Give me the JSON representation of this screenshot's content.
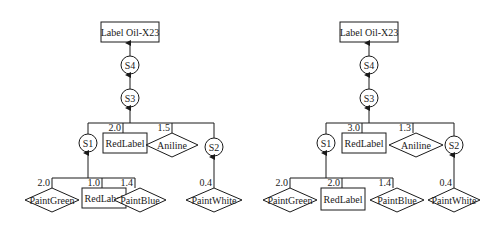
{
  "diagrams": [
    {
      "root": "Label Oil-X23",
      "s4": "S4",
      "s3": "S3",
      "s1": "S1",
      "s2": "S2",
      "top_red_label": {
        "name": "RedLabel",
        "weight": "2.0"
      },
      "aniline": {
        "name": "Aniline",
        "weight": "1.5"
      },
      "paint_green": {
        "name": "PaintGreen",
        "weight": "2.0"
      },
      "s1_red_label": {
        "name": "RedLabel",
        "weight": "1.0"
      },
      "paint_blue": {
        "name": "PaintBlue",
        "weight": "1.4"
      },
      "paint_white": {
        "name": "PaintWhite",
        "weight": "0.4"
      }
    },
    {
      "root": "Label Oil-X23",
      "s4": "S4",
      "s3": "S3",
      "s1": "S1",
      "s2": "S2",
      "top_red_label": {
        "name": "RedLabel",
        "weight": "3.0"
      },
      "aniline": {
        "name": "Aniline",
        "weight": "1.3"
      },
      "paint_green": {
        "name": "PaintGreen",
        "weight": "2.0"
      },
      "s1_red_label": {
        "name": "RedLabel",
        "weight": "2.0"
      },
      "paint_blue": {
        "name": "PaintBlue",
        "weight": "1.4"
      },
      "paint_white": {
        "name": "PaintWhite",
        "weight": "0.4"
      }
    }
  ]
}
